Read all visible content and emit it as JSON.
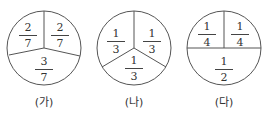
{
  "diagrams": [
    {
      "caption": "(가)",
      "parts": [
        {
          "num": "2",
          "den": "7"
        },
        {
          "num": "2",
          "den": "7"
        },
        {
          "num": "3",
          "den": "7"
        }
      ]
    },
    {
      "caption": "(나)",
      "parts": [
        {
          "num": "1",
          "den": "3"
        },
        {
          "num": "1",
          "den": "3"
        },
        {
          "num": "1",
          "den": "3"
        }
      ]
    },
    {
      "caption": "(다)",
      "parts": [
        {
          "num": "1",
          "den": "4"
        },
        {
          "num": "1",
          "den": "4"
        },
        {
          "num": "1",
          "den": "2"
        }
      ]
    }
  ],
  "colors": {
    "stroke": "#444444",
    "background": "#ffffff"
  }
}
